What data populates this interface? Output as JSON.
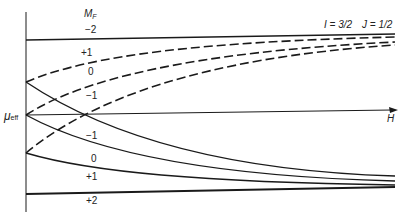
{
  "diagram": {
    "quantum_numbers": {
      "I_label": "I = 3/2",
      "J_label": "J = 1/2"
    },
    "axes": {
      "y_label": "μ",
      "y_label_sub": "eff",
      "x_label": "H"
    },
    "column_header": "M",
    "column_header_sub": "F",
    "levels_upper": [
      {
        "mf": "−2",
        "style": "solid"
      },
      {
        "mf": "+1",
        "style": "dashed"
      },
      {
        "mf": "0",
        "style": "dashed"
      },
      {
        "mf": "−1",
        "style": "dashed"
      }
    ],
    "levels_lower": [
      {
        "mf": "−1",
        "style": "solid"
      },
      {
        "mf": "0",
        "style": "solid"
      },
      {
        "mf": "+1",
        "style": "solid"
      },
      {
        "mf": "+2",
        "style": "solid"
      }
    ],
    "colors": {
      "line": "#1a1a1a",
      "background": "#ffffff"
    }
  }
}
